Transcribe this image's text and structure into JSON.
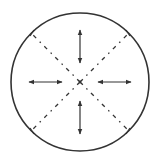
{
  "diagram": {
    "type": "radial-expansion",
    "circle": {
      "cx": 80,
      "cy": 82,
      "r": 69,
      "stroke": "#333333",
      "stroke_width": 1.6
    },
    "center": {
      "x": 80,
      "y": 82
    },
    "colors": {
      "stroke": "#333333",
      "background": "#ffffff"
    },
    "diagonals": [
      {
        "name": "upper-left",
        "x1": 80,
        "y1": 82,
        "x2": 31,
        "y2": 33
      },
      {
        "name": "upper-right",
        "x1": 80,
        "y1": 82,
        "x2": 129,
        "y2": 33
      },
      {
        "name": "lower-left",
        "x1": 80,
        "y1": 82,
        "x2": 31,
        "y2": 131
      },
      {
        "name": "lower-right",
        "x1": 80,
        "y1": 82,
        "x2": 129,
        "y2": 131
      }
    ],
    "arrows": [
      {
        "name": "top",
        "x1": 80,
        "y1": 30,
        "x2": 80,
        "y2": 63
      },
      {
        "name": "bottom",
        "x1": 80,
        "y1": 101,
        "x2": 80,
        "y2": 134
      },
      {
        "name": "left",
        "x1": 29,
        "y1": 82,
        "x2": 62,
        "y2": 82
      },
      {
        "name": "right",
        "x1": 98,
        "y1": 82,
        "x2": 131,
        "y2": 82
      }
    ]
  }
}
